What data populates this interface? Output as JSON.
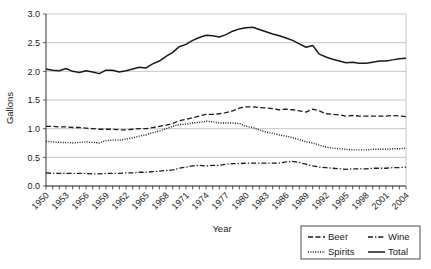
{
  "chart_data": {
    "type": "line",
    "title": "",
    "xlabel": "Year",
    "ylabel": "Gallons",
    "ylim": [
      0.0,
      3.0
    ],
    "yticks": [
      "0.0",
      "0.5",
      "1.0",
      "1.5",
      "2.0",
      "2.5",
      "3.0"
    ],
    "grid": true,
    "legend_position": "bottom-right",
    "x": [
      1950,
      1951,
      1952,
      1953,
      1954,
      1955,
      1956,
      1957,
      1958,
      1959,
      1960,
      1961,
      1962,
      1963,
      1964,
      1965,
      1966,
      1967,
      1968,
      1969,
      1970,
      1971,
      1972,
      1973,
      1974,
      1975,
      1976,
      1977,
      1978,
      1979,
      1980,
      1981,
      1982,
      1983,
      1984,
      1985,
      1986,
      1987,
      1988,
      1989,
      1990,
      1991,
      1992,
      1993,
      1994,
      1995,
      1996,
      1997,
      1998,
      1999,
      2000,
      2001,
      2002,
      2003,
      2004
    ],
    "xtick_labels": [
      "1950",
      "1953",
      "1956",
      "1959",
      "1962",
      "1965",
      "1968",
      "1971",
      "1974",
      "1977",
      "1980",
      "1983",
      "1986",
      "1989",
      "1992",
      "1995",
      "1998",
      "2001",
      "2004"
    ],
    "series": [
      {
        "name": "Beer",
        "style": "dashed",
        "values": [
          1.04,
          1.04,
          1.03,
          1.03,
          1.02,
          1.02,
          1.01,
          1.0,
          0.99,
          0.99,
          0.99,
          0.98,
          0.98,
          0.99,
          1.0,
          1.0,
          1.02,
          1.04,
          1.06,
          1.09,
          1.14,
          1.16,
          1.19,
          1.22,
          1.25,
          1.25,
          1.26,
          1.28,
          1.31,
          1.36,
          1.38,
          1.38,
          1.37,
          1.36,
          1.35,
          1.33,
          1.34,
          1.33,
          1.31,
          1.29,
          1.34,
          1.31,
          1.26,
          1.25,
          1.24,
          1.22,
          1.23,
          1.22,
          1.22,
          1.22,
          1.22,
          1.22,
          1.23,
          1.22,
          1.21
        ]
      },
      {
        "name": "Wine",
        "style": "dash-dot",
        "values": [
          0.23,
          0.22,
          0.22,
          0.22,
          0.22,
          0.22,
          0.22,
          0.21,
          0.21,
          0.22,
          0.22,
          0.22,
          0.23,
          0.23,
          0.24,
          0.24,
          0.25,
          0.26,
          0.27,
          0.28,
          0.31,
          0.33,
          0.35,
          0.36,
          0.35,
          0.36,
          0.36,
          0.38,
          0.39,
          0.39,
          0.4,
          0.4,
          0.4,
          0.4,
          0.4,
          0.4,
          0.42,
          0.43,
          0.41,
          0.38,
          0.35,
          0.33,
          0.32,
          0.31,
          0.3,
          0.29,
          0.3,
          0.3,
          0.3,
          0.31,
          0.31,
          0.31,
          0.32,
          0.32,
          0.33
        ]
      },
      {
        "name": "Spirits",
        "style": "dotted",
        "values": [
          0.78,
          0.77,
          0.76,
          0.76,
          0.75,
          0.76,
          0.77,
          0.76,
          0.75,
          0.79,
          0.8,
          0.8,
          0.82,
          0.84,
          0.87,
          0.89,
          0.93,
          0.96,
          1.0,
          1.04,
          1.07,
          1.08,
          1.1,
          1.11,
          1.13,
          1.12,
          1.1,
          1.1,
          1.1,
          1.09,
          1.04,
          1.02,
          0.98,
          0.94,
          0.92,
          0.89,
          0.87,
          0.84,
          0.81,
          0.77,
          0.75,
          0.71,
          0.68,
          0.66,
          0.65,
          0.64,
          0.63,
          0.63,
          0.63,
          0.64,
          0.64,
          0.64,
          0.65,
          0.65,
          0.66
        ]
      },
      {
        "name": "Total",
        "style": "solid",
        "values": [
          2.04,
          2.02,
          2.01,
          2.05,
          2.0,
          1.98,
          2.01,
          1.99,
          1.96,
          2.02,
          2.02,
          1.99,
          2.01,
          2.04,
          2.07,
          2.06,
          2.13,
          2.18,
          2.26,
          2.33,
          2.43,
          2.47,
          2.54,
          2.59,
          2.63,
          2.62,
          2.6,
          2.64,
          2.7,
          2.74,
          2.76,
          2.77,
          2.73,
          2.69,
          2.65,
          2.62,
          2.58,
          2.54,
          2.48,
          2.42,
          2.45,
          2.3,
          2.25,
          2.21,
          2.18,
          2.15,
          2.16,
          2.14,
          2.14,
          2.16,
          2.18,
          2.18,
          2.2,
          2.22,
          2.23
        ]
      }
    ]
  },
  "legend": {
    "entries": [
      {
        "label": "Beer",
        "style": "dashed"
      },
      {
        "label": "Wine",
        "style": "dash-dot"
      },
      {
        "label": "Spirits",
        "style": "dotted"
      },
      {
        "label": "Total",
        "style": "solid"
      }
    ]
  },
  "colors": {
    "line": "#1a1a1a",
    "grid": "#b8b8b8",
    "axis": "#333333",
    "background": "#ffffff"
  }
}
